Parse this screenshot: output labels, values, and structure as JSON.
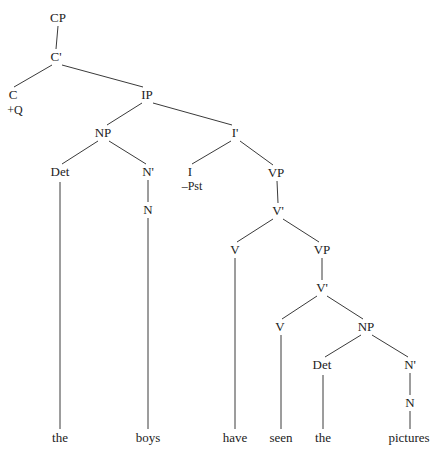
{
  "figure": {
    "kind": "syntax-tree",
    "notation": "x-bar",
    "sentence": "the boys have seen the pictures",
    "background_color": "#ffffff",
    "line_color": "#3a3a3a",
    "text_color": "#222222",
    "width": 438,
    "height": 460
  },
  "nodes": [
    {
      "id": "cp",
      "label": "CP",
      "x": 58,
      "y": 18
    },
    {
      "id": "cbar",
      "label": "C'",
      "x": 56,
      "y": 57
    },
    {
      "id": "c",
      "label": "C",
      "x": 13,
      "y": 95
    },
    {
      "id": "c_feature",
      "label": "+Q",
      "x": 15,
      "y": 110
    },
    {
      "id": "ip",
      "label": "IP",
      "x": 147,
      "y": 95
    },
    {
      "id": "np1",
      "label": "NP",
      "x": 103,
      "y": 133
    },
    {
      "id": "ibar",
      "label": "I'",
      "x": 235,
      "y": 133
    },
    {
      "id": "det1",
      "label": "Det",
      "x": 60,
      "y": 172
    },
    {
      "id": "nbar1",
      "label": "N'",
      "x": 148,
      "y": 172
    },
    {
      "id": "i",
      "label": "I",
      "x": 190,
      "y": 172
    },
    {
      "id": "i_feature",
      "label": "–Pst",
      "x": 192,
      "y": 186
    },
    {
      "id": "vp1",
      "label": "VP",
      "x": 276,
      "y": 173
    },
    {
      "id": "n1",
      "label": "N",
      "x": 148,
      "y": 210
    },
    {
      "id": "vbar1",
      "label": "V'",
      "x": 278,
      "y": 211
    },
    {
      "id": "v1",
      "label": "V",
      "x": 235,
      "y": 250
    },
    {
      "id": "vp2",
      "label": "VP",
      "x": 322,
      "y": 250
    },
    {
      "id": "vbar2",
      "label": "V'",
      "x": 322,
      "y": 288
    },
    {
      "id": "v2",
      "label": "V",
      "x": 280,
      "y": 327
    },
    {
      "id": "np2",
      "label": "NP",
      "x": 366,
      "y": 327
    },
    {
      "id": "det2",
      "label": "Det",
      "x": 322,
      "y": 365
    },
    {
      "id": "nbar2",
      "label": "N'",
      "x": 410,
      "y": 365
    },
    {
      "id": "n2",
      "label": "N",
      "x": 410,
      "y": 403
    }
  ],
  "terminals": [
    {
      "id": "t_the1",
      "label": "the",
      "x": 60,
      "y": 438
    },
    {
      "id": "t_boys",
      "label": "boys",
      "x": 148,
      "y": 438
    },
    {
      "id": "t_have",
      "label": "have",
      "x": 235,
      "y": 438
    },
    {
      "id": "t_seen",
      "label": "seen",
      "x": 281,
      "y": 438
    },
    {
      "id": "t_the2",
      "label": "the",
      "x": 323,
      "y": 438
    },
    {
      "id": "t_pictures",
      "label": "pictures",
      "x": 409,
      "y": 438
    }
  ],
  "edges": [
    {
      "id": "e-cp-cbar",
      "from": "cp",
      "to": "cbar",
      "x1": 58,
      "y1": 26,
      "x2": 56,
      "y2": 49
    },
    {
      "id": "e-cbar-c",
      "from": "cbar",
      "to": "c",
      "x1": 52,
      "y1": 65,
      "x2": 14,
      "y2": 87
    },
    {
      "id": "e-cbar-ip",
      "from": "cbar",
      "to": "ip",
      "x1": 62,
      "y1": 65,
      "x2": 143,
      "y2": 87
    },
    {
      "id": "e-ip-np1",
      "from": "ip",
      "to": "np1",
      "x1": 142,
      "y1": 103,
      "x2": 107,
      "y2": 125
    },
    {
      "id": "e-ip-ibar",
      "from": "ip",
      "to": "ibar",
      "x1": 153,
      "y1": 103,
      "x2": 232,
      "y2": 125
    },
    {
      "id": "e-np1-det1",
      "from": "np1",
      "to": "det1",
      "x1": 98,
      "y1": 141,
      "x2": 62,
      "y2": 164
    },
    {
      "id": "e-np1-nbar1",
      "from": "np1",
      "to": "nbar1",
      "x1": 109,
      "y1": 141,
      "x2": 146,
      "y2": 164
    },
    {
      "id": "e-ibar-i",
      "from": "ibar",
      "to": "i",
      "x1": 231,
      "y1": 141,
      "x2": 192,
      "y2": 164
    },
    {
      "id": "e-ibar-vp1",
      "from": "ibar",
      "to": "vp1",
      "x1": 240,
      "y1": 141,
      "x2": 273,
      "y2": 165
    },
    {
      "id": "e-nbar1-n1",
      "from": "nbar1",
      "to": "n1",
      "x1": 148,
      "y1": 180,
      "x2": 148,
      "y2": 202
    },
    {
      "id": "e-vp1-vbar1",
      "from": "vp1",
      "to": "vbar1",
      "x1": 277,
      "y1": 181,
      "x2": 278,
      "y2": 203
    },
    {
      "id": "e-vbar1-v1",
      "from": "vbar1",
      "to": "v1",
      "x1": 273,
      "y1": 219,
      "x2": 237,
      "y2": 242
    },
    {
      "id": "e-vbar1-vp2",
      "from": "vbar1",
      "to": "vp2",
      "x1": 283,
      "y1": 219,
      "x2": 319,
      "y2": 242
    },
    {
      "id": "e-vp2-vbar2",
      "from": "vp2",
      "to": "vbar2",
      "x1": 322,
      "y1": 258,
      "x2": 322,
      "y2": 280
    },
    {
      "id": "e-vbar2-v2",
      "from": "vbar2",
      "to": "v2",
      "x1": 317,
      "y1": 296,
      "x2": 282,
      "y2": 319
    },
    {
      "id": "e-vbar2-np2",
      "from": "vbar2",
      "to": "np2",
      "x1": 327,
      "y1": 296,
      "x2": 363,
      "y2": 319
    },
    {
      "id": "e-np2-det2",
      "from": "np2",
      "to": "det2",
      "x1": 361,
      "y1": 335,
      "x2": 325,
      "y2": 357
    },
    {
      "id": "e-np2-nbar2",
      "from": "np2",
      "to": "nbar2",
      "x1": 372,
      "y1": 335,
      "x2": 408,
      "y2": 357
    },
    {
      "id": "e-nbar2-n2",
      "from": "nbar2",
      "to": "n2",
      "x1": 410,
      "y1": 373,
      "x2": 410,
      "y2": 395
    },
    {
      "id": "e-det1-the1",
      "from": "det1",
      "to": "t_the1",
      "x1": 60,
      "y1": 182,
      "x2": 60,
      "y2": 429
    },
    {
      "id": "e-n1-boys",
      "from": "n1",
      "to": "t_boys",
      "x1": 148,
      "y1": 218,
      "x2": 148,
      "y2": 429
    },
    {
      "id": "e-v1-have",
      "from": "v1",
      "to": "t_have",
      "x1": 235,
      "y1": 258,
      "x2": 235,
      "y2": 429
    },
    {
      "id": "e-v2-seen",
      "from": "v2",
      "to": "t_seen",
      "x1": 281,
      "y1": 335,
      "x2": 281,
      "y2": 429
    },
    {
      "id": "e-det2-the2",
      "from": "det2",
      "to": "t_the2",
      "x1": 323,
      "y1": 375,
      "x2": 323,
      "y2": 429
    },
    {
      "id": "e-n2-pictures",
      "from": "n2",
      "to": "t_pictures",
      "x1": 410,
      "y1": 411,
      "x2": 410,
      "y2": 429
    }
  ]
}
